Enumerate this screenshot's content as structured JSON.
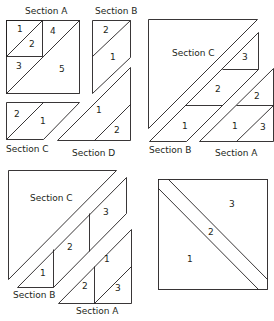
{
  "diagram": {
    "type": "quilt-block-piecing-diagram",
    "panels": [
      {
        "id": "top-left",
        "sections": [
          {
            "label": "Section A",
            "pieces": [
              "1",
              "2",
              "3",
              "4",
              "5"
            ]
          },
          {
            "label": "Section B",
            "pieces": [
              "2",
              "1"
            ]
          },
          {
            "label": "Section C",
            "pieces": [
              "2",
              "1"
            ]
          },
          {
            "label": "Section D",
            "pieces": [
              "1",
              "2"
            ]
          }
        ]
      },
      {
        "id": "top-right",
        "sections": [
          {
            "label": "Section C",
            "pieces": []
          },
          {
            "label": "Section B",
            "pieces": [
              "3",
              "2",
              "1"
            ]
          },
          {
            "label": "Section A",
            "pieces": [
              "2",
              "1",
              "3"
            ]
          }
        ]
      },
      {
        "id": "bottom-left",
        "sections": [
          {
            "label": "Section C",
            "pieces": []
          },
          {
            "label": "Section B",
            "pieces": [
              "1",
              "2",
              "3"
            ]
          },
          {
            "label": "Section A",
            "pieces": [
              "1",
              "2",
              "3"
            ]
          }
        ]
      },
      {
        "id": "bottom-right",
        "sections": [
          {
            "label": "",
            "pieces": [
              "1",
              "2",
              "3"
            ]
          }
        ]
      }
    ]
  },
  "labels": {
    "tl_section_a": "Section A",
    "tl_section_b": "Section B",
    "tl_section_c": "Section C",
    "tl_section_d": "Section D",
    "tr_section_c": "Section C",
    "tr_section_b": "Section B",
    "tr_section_a": "Section A",
    "bl_section_c": "Section C",
    "bl_section_b": "Section B",
    "bl_section_a": "Section A"
  },
  "pieces": {
    "tl_a_1": "1",
    "tl_a_2": "2",
    "tl_a_3": "3",
    "tl_a_4": "4",
    "tl_a_5": "5",
    "tl_b_2": "2",
    "tl_b_1": "1",
    "tl_c_2": "2",
    "tl_c_1": "1",
    "tl_d_1": "1",
    "tl_d_2": "2",
    "tr_b_3": "3",
    "tr_b_2": "2",
    "tr_b_1": "1",
    "tr_a_2": "2",
    "tr_a_1": "1",
    "tr_a_3": "3",
    "bl_b_1": "1",
    "bl_b_2": "2",
    "bl_b_3": "3",
    "bl_a_1": "1",
    "bl_a_2": "2",
    "bl_a_3": "3",
    "br_3": "3",
    "br_2": "2",
    "br_1": "1"
  }
}
